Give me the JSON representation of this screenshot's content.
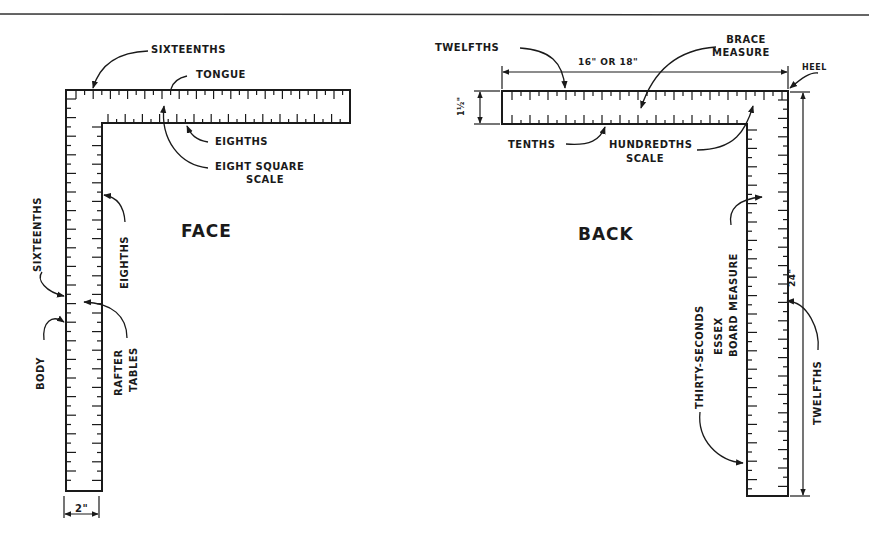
{
  "figure": {
    "title_line": true,
    "views": [
      {
        "name": "face",
        "title": "FACE",
        "labels": {
          "tongue_edge_top": "SIXTEENTHS",
          "tongue": "TONGUE",
          "tongue_edge_bottom": "EIGHTHS",
          "eight_square_line1": "EIGHT SQUARE",
          "eight_square_line2": "SCALE",
          "body_edge_outer": "SIXTEENTHS",
          "body_edge_inner": "EIGHTHS",
          "body": "BODY",
          "rafter_line1": "RAFTER",
          "rafter_line2": "TABLES",
          "body_width": "2\""
        }
      },
      {
        "name": "back",
        "title": "BACK",
        "labels": {
          "tongue_edge_top": "TWELFTHS",
          "tongue_length": "16\" OR 18\"",
          "brace_line1": "BRACE",
          "brace_line2": "MEASURE",
          "heel": "HEEL",
          "tongue_width": "1½\"",
          "tongue_edge_bottom": "TENTHS",
          "hundredths_line1": "HUNDREDTHS",
          "hundredths_line2": "SCALE",
          "body_outer_line1": "THIRTY-SECONDS",
          "body_outer_line2": "ESSEX",
          "body_outer_line3": "BOARD MEASURE",
          "body_length": "24\"",
          "body_edge_right": "TWELFTHS"
        }
      }
    ]
  },
  "colors": {
    "ink": "#1a1a1a",
    "paper": "#ffffff"
  }
}
